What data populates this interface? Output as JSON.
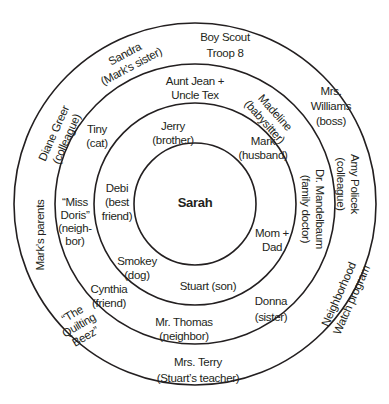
{
  "diagram": {
    "type": "concentric-circles",
    "colors": {
      "line": "#231f20",
      "background": "#ffffff",
      "text": "#231f20"
    },
    "center": {
      "label": "Sarah"
    },
    "rings": [
      {
        "level": 1,
        "items": [
          {
            "line1": "Jerry",
            "line2": "(brother)"
          },
          {
            "line1": "Mark",
            "line2": "(husband)"
          },
          {
            "line1": "Debi",
            "line2": "(best",
            "line3": "friend)"
          },
          {
            "line1": "Mom +",
            "line2": "Dad"
          },
          {
            "line1": "Smokey",
            "line2": "(dog)"
          },
          {
            "line1": "Stuart (son)"
          }
        ]
      },
      {
        "level": 2,
        "items": [
          {
            "line1": "Aunt Jean +",
            "line2": "Uncle Tex"
          },
          {
            "line1": "Tiny",
            "line2": "(cat)"
          },
          {
            "line1": "Madeline",
            "line2": "(babysitter)"
          },
          {
            "line1": "“Miss",
            "line2": "Doris”",
            "line3": "(neigh-",
            "line4": "bor)"
          },
          {
            "line1": "Dr. Mandelbaum",
            "line2": "(family doctor)"
          },
          {
            "line1": "Cynthia",
            "line2": "(friend)"
          },
          {
            "line1": "Donna",
            "line2": "(sister)"
          },
          {
            "line1": "Mr. Thomas",
            "line2": "(neighbor)"
          }
        ]
      },
      {
        "level": 3,
        "items": [
          {
            "line1": "Boy Scout",
            "line2": "Troop 8"
          },
          {
            "line1": "Sandra",
            "line2": "(Mark’s sister)"
          },
          {
            "line1": "Mrs.",
            "line2": "Williams",
            "line3": "(boss)"
          },
          {
            "line1": "Diane Greer",
            "line2": "(colleague)"
          },
          {
            "line1": "Amy Policek",
            "line2": "(colleague)"
          },
          {
            "line1": "Mark’s parents"
          },
          {
            "line1": "Neighborhood",
            "line2": "Watch program"
          },
          {
            "line1": "“The",
            "line2": "Quilting",
            "line3": "Beez”"
          },
          {
            "line1": "Mrs. Terry",
            "line2": "(Stuart’s teacher)"
          }
        ]
      }
    ]
  }
}
